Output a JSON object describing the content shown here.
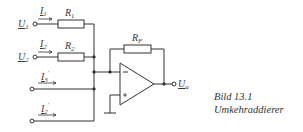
{
  "diagram": {
    "type": "circuit-schematic",
    "inputs": [
      {
        "voltage": "U",
        "voltage_sub": "1",
        "current": "I",
        "current_sub": "1",
        "resistor": "R",
        "resistor_sub": "1"
      },
      {
        "voltage": "U",
        "voltage_sub": "2",
        "current": "I",
        "current_sub": "2",
        "resistor": "R",
        "resistor_sub": "2"
      },
      {
        "current": "I",
        "current_sub": "3",
        "current_prime": "'"
      },
      {
        "current": "I",
        "current_sub": "2",
        "current_prime": "'"
      }
    ],
    "feedback_resistor": {
      "label": "R",
      "sub": "F"
    },
    "opamp": {
      "inverting": "−",
      "noninverting": "+"
    },
    "output": {
      "label": "U",
      "sub": "a"
    },
    "line_color": "#333333"
  },
  "caption": {
    "figure": "Bild 13.1",
    "title": "Umkehraddierer"
  }
}
